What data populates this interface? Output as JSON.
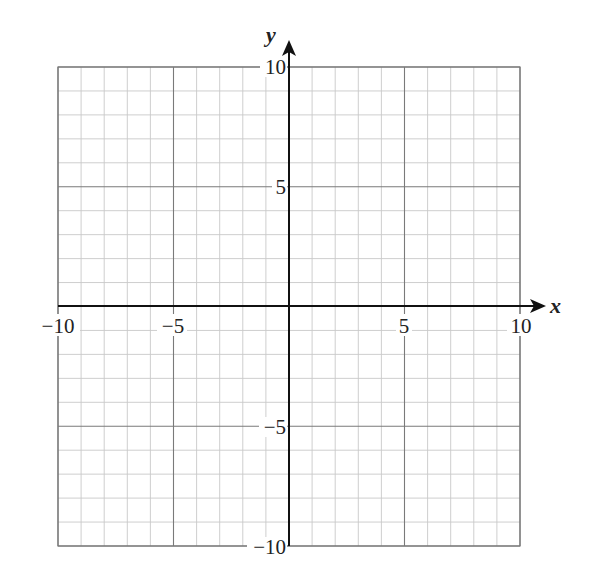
{
  "chart_data": {
    "type": "scatter",
    "title": "",
    "xlabel": "x",
    "ylabel": "y",
    "xlim": [
      -10,
      10
    ],
    "ylim": [
      -10,
      10
    ],
    "grid": true,
    "minor_grid_step": 1,
    "major_grid_step": 5,
    "x_tick_labels": [
      "−10",
      "−5",
      "5",
      "10"
    ],
    "y_tick_labels": [
      "10",
      "5",
      "−5",
      "−10"
    ],
    "series": []
  },
  "axes": {
    "x_label": "x",
    "y_label": "y",
    "x_ticks": [
      {
        "value": -10,
        "label": "−10"
      },
      {
        "value": -5,
        "label": "−5"
      },
      {
        "value": 5,
        "label": "5"
      },
      {
        "value": 10,
        "label": "10"
      }
    ],
    "y_ticks": [
      {
        "value": 10,
        "label": "10"
      },
      {
        "value": 5,
        "label": "5"
      },
      {
        "value": -5,
        "label": "−5"
      },
      {
        "value": -10,
        "label": "−10"
      }
    ]
  },
  "colors": {
    "minor_grid": "#c8c8c8",
    "major_grid": "#7a7a7a",
    "axis": "#111111"
  }
}
